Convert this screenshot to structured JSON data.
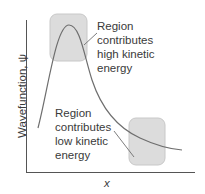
{
  "diagram": {
    "type": "wavefunction-kinetic-energy",
    "axes": {
      "y_label": "Wavefunction, ψ",
      "x_label": "x"
    },
    "annotations": [
      {
        "id": "high",
        "lines": [
          "Region",
          "contributes",
          "high kinetic",
          "energy"
        ]
      },
      {
        "id": "low",
        "lines": [
          "Region",
          "contributes",
          "low kinetic",
          "energy"
        ]
      }
    ],
    "colors": {
      "axis": "#555555",
      "curve": "#6e6e6e",
      "region_fill": "#dcdcdc",
      "region_stroke": "#c8c8c8",
      "text": "#3a3a3a"
    }
  }
}
